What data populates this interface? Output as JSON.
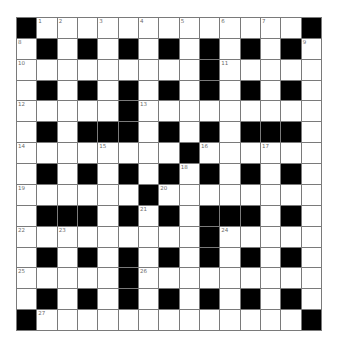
{
  "puzzle": {
    "rows": 15,
    "cols": 15,
    "grid": [
      "#.............#",
      ".#.#.#.#.#.#.#.",
      ".........#.....",
      ".#.#.#.#.#.#.#.",
      ".....#.........",
      ".#.###.#.#.###.",
      "........#......",
      ".#.#.#.#.#.#.#.",
      "......#........",
      ".###.#.#.###.#.",
      ".........#.....",
      ".#.#.#.#.#.#.#.",
      ".....#.........",
      ".#.#.#.#.#.#.#.",
      "#.............#"
    ],
    "numbers": [
      {
        "n": "1",
        "r": 0,
        "c": 1
      },
      {
        "n": "2",
        "r": 0,
        "c": 2
      },
      {
        "n": "3",
        "r": 0,
        "c": 4
      },
      {
        "n": "4",
        "r": 0,
        "c": 6
      },
      {
        "n": "5",
        "r": 0,
        "c": 8
      },
      {
        "n": "6",
        "r": 0,
        "c": 10
      },
      {
        "n": "7",
        "r": 0,
        "c": 12
      },
      {
        "n": "8",
        "r": 1,
        "c": 0
      },
      {
        "n": "9",
        "r": 1,
        "c": 14
      },
      {
        "n": "10",
        "r": 2,
        "c": 0
      },
      {
        "n": "11",
        "r": 2,
        "c": 10
      },
      {
        "n": "12",
        "r": 4,
        "c": 0
      },
      {
        "n": "13",
        "r": 4,
        "c": 6
      },
      {
        "n": "14",
        "r": 6,
        "c": 0
      },
      {
        "n": "15",
        "r": 6,
        "c": 4
      },
      {
        "n": "16",
        "r": 6,
        "c": 9
      },
      {
        "n": "17",
        "r": 6,
        "c": 12
      },
      {
        "n": "18",
        "r": 7,
        "c": 8
      },
      {
        "n": "19",
        "r": 8,
        "c": 0
      },
      {
        "n": "20",
        "r": 8,
        "c": 7
      },
      {
        "n": "21",
        "r": 9,
        "c": 6
      },
      {
        "n": "22",
        "r": 10,
        "c": 0
      },
      {
        "n": "23",
        "r": 10,
        "c": 2
      },
      {
        "n": "24",
        "r": 10,
        "c": 10
      },
      {
        "n": "25",
        "r": 12,
        "c": 0
      },
      {
        "n": "26",
        "r": 12,
        "c": 6
      },
      {
        "n": "27",
        "r": 14,
        "c": 1
      }
    ],
    "colors": {
      "block": "#000000",
      "cell": "#ffffff",
      "gridline": "#7a7a7a",
      "number": "#6b6b6b"
    }
  }
}
